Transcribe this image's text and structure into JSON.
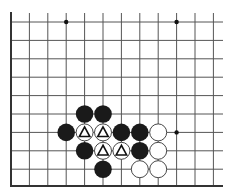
{
  "diagram": {
    "type": "go-board-fragment",
    "edges": [
      "left",
      "bottom"
    ],
    "columns": 12,
    "rows": 10,
    "line_color": "#555555",
    "edge_color": "#333333",
    "black_color": "#1a1a1a",
    "white_color": "#ffffff",
    "star_points": [
      [
        3,
        0
      ],
      [
        9,
        0
      ],
      [
        9,
        6
      ]
    ],
    "stones": [
      {
        "col": 4,
        "row": 5,
        "color": "black",
        "mark": ""
      },
      {
        "col": 5,
        "row": 5,
        "color": "black",
        "mark": ""
      },
      {
        "col": 3,
        "row": 6,
        "color": "black",
        "mark": ""
      },
      {
        "col": 4,
        "row": 6,
        "color": "white",
        "mark": "triangle"
      },
      {
        "col": 5,
        "row": 6,
        "color": "white",
        "mark": "triangle"
      },
      {
        "col": 6,
        "row": 6,
        "color": "black",
        "mark": ""
      },
      {
        "col": 7,
        "row": 6,
        "color": "black",
        "mark": ""
      },
      {
        "col": 8,
        "row": 6,
        "color": "white",
        "mark": ""
      },
      {
        "col": 4,
        "row": 7,
        "color": "black",
        "mark": ""
      },
      {
        "col": 5,
        "row": 7,
        "color": "white",
        "mark": "triangle"
      },
      {
        "col": 6,
        "row": 7,
        "color": "white",
        "mark": "triangle"
      },
      {
        "col": 7,
        "row": 7,
        "color": "black",
        "mark": ""
      },
      {
        "col": 8,
        "row": 7,
        "color": "white",
        "mark": ""
      },
      {
        "col": 5,
        "row": 8,
        "color": "black",
        "mark": ""
      },
      {
        "col": 7,
        "row": 8,
        "color": "white",
        "mark": ""
      },
      {
        "col": 8,
        "row": 8,
        "color": "white",
        "mark": ""
      }
    ]
  }
}
